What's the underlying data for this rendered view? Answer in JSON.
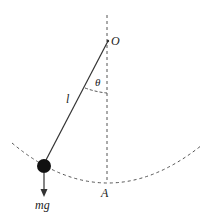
{
  "diagram": {
    "labels": {
      "pivot": "O",
      "angle": "θ",
      "length": "l",
      "lowest_point": "A",
      "weight": "mg"
    },
    "colors": {
      "line": "#333333",
      "bob": "#111111",
      "dashed": "#555555",
      "background": "#ffffff"
    }
  }
}
